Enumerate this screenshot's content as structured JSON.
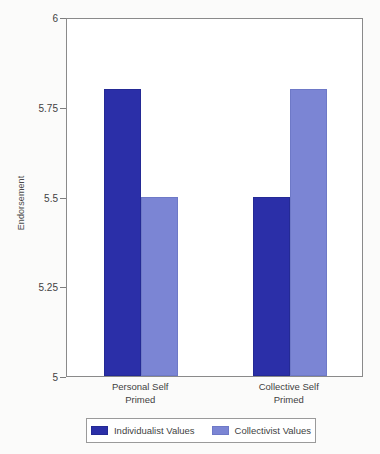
{
  "chart_data": {
    "type": "bar",
    "title": "",
    "xlabel": "",
    "ylabel": "Endorsement",
    "ylim": [
      5,
      6
    ],
    "yticks": [
      5,
      5.25,
      5.5,
      5.75,
      6
    ],
    "ytick_labels": [
      "5",
      "5.25",
      "5.5",
      "5.75",
      "6"
    ],
    "grid": false,
    "legend_position": "bottom",
    "categories": [
      "Personal Self\nPrimed",
      "Collective Self\nPrimed"
    ],
    "series": [
      {
        "name": "Individualist Values",
        "color": "#2b2fa8",
        "values": [
          5.8,
          5.5
        ]
      },
      {
        "name": "Collectivist Values",
        "color": "#7b85d4",
        "values": [
          5.5,
          5.8
        ]
      }
    ]
  }
}
